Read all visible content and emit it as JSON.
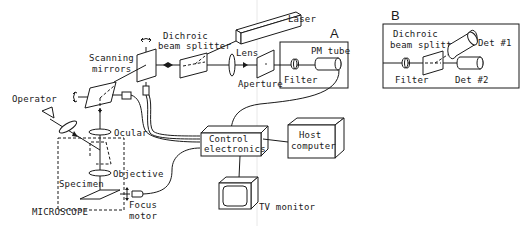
{
  "figure": {
    "panel_a": {
      "letter": "A",
      "labels": {
        "laser": "Laser",
        "dichroic_1": "Dichroic",
        "dichroic_2": "beam splitter",
        "lens": "Lens",
        "aperture": "Aperture",
        "filter": "Filter",
        "pm_tube": "PM tube",
        "scanning_1": "Scanning",
        "scanning_2": "mirrors",
        "operator": "Operator",
        "ocular": "Ocular",
        "objective": "Objective",
        "specimen": "Specimen",
        "microscope": "MICROSCOPE",
        "focus_1": "Focus",
        "focus_2": "motor",
        "control_1": "Control",
        "control_2": "electronics",
        "host_1": "Host",
        "host_2": "computer",
        "tv": "TV monitor"
      }
    },
    "panel_b": {
      "letter": "B",
      "labels": {
        "dichroic_1": "Dichroic",
        "dichroic_2": "beam splitter",
        "filter": "Filter",
        "det1": "Det #1",
        "det2": "Det #2"
      }
    }
  },
  "colors": {
    "ink": "#1a1a1a",
    "background": "#ffffff"
  }
}
